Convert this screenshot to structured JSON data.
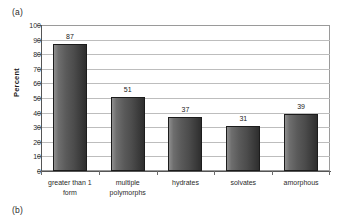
{
  "figure": {
    "part_a_label": "(a)",
    "part_b_label": "(b)"
  },
  "chart_data": {
    "type": "bar",
    "title": "",
    "subtitle": "",
    "xlabel": "",
    "ylabel": "Percent",
    "ylim": [
      0,
      100
    ],
    "ytick_step": 10,
    "yticks": [
      100,
      90,
      80,
      70,
      60,
      50,
      40,
      30,
      20,
      10,
      0
    ],
    "ytick_labels": [
      "100",
      "90",
      "80",
      "70",
      "60",
      "50",
      "40",
      "30",
      "20",
      "10",
      "0"
    ],
    "grid": "horizontal",
    "legend": "none",
    "bar_color": "#4c4c4c",
    "bar_edge_color": "#1c1c1c",
    "categories": [
      "greater than 1 form",
      "multiple polymorphs",
      "hydrates",
      "solvates",
      "amorphous"
    ],
    "category_lines": [
      [
        "greater than 1",
        "form"
      ],
      [
        "multiple",
        "polymorphs"
      ],
      [
        "hydrates"
      ],
      [
        "solvates"
      ],
      [
        "amorphous"
      ]
    ],
    "values": [
      87,
      51,
      37,
      31,
      39
    ],
    "value_labels": [
      "87",
      "51",
      "37",
      "31",
      "39"
    ]
  }
}
